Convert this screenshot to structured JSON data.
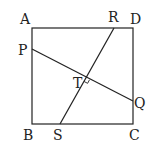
{
  "diagram": {
    "type": "geometry",
    "labels": {
      "A": "A",
      "B": "B",
      "C": "C",
      "D": "D",
      "P": "P",
      "Q": "Q",
      "R": "R",
      "S": "S",
      "T": "T"
    },
    "points": {
      "A": [
        32,
        28
      ],
      "B": [
        32,
        124
      ],
      "C": [
        133,
        124
      ],
      "D": [
        133,
        28
      ],
      "P": [
        32,
        49
      ],
      "Q": [
        133,
        101
      ],
      "R": [
        114,
        28
      ],
      "S": [
        60,
        124
      ],
      "T": [
        86,
        78
      ]
    },
    "segments": [
      [
        "A",
        "B"
      ],
      [
        "B",
        "C"
      ],
      [
        "C",
        "D"
      ],
      [
        "D",
        "A"
      ],
      [
        "P",
        "Q"
      ],
      [
        "R",
        "S"
      ]
    ],
    "right_angle_at": "T"
  }
}
